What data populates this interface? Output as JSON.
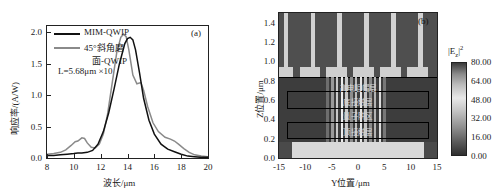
{
  "figure": {
    "panels": [
      "a",
      "b"
    ]
  },
  "panel_a": {
    "tag": "(a)",
    "xlabel": "波长/μm",
    "ylabel": "响应率/(A/W)",
    "annotation": "L=5.68μm  ×10",
    "xticks": [
      "8",
      "10",
      "12",
      "14",
      "16",
      "18",
      "20"
    ],
    "yticks": [
      "0.0",
      "0.5",
      "1.0",
      "1.5",
      "2.0"
    ],
    "legend": [
      {
        "label": "MIM-QWIP",
        "color": "#111111"
      },
      {
        "label": "45°斜角磨",
        "label2": "面-QWIP",
        "color": "#888888"
      }
    ]
  },
  "panel_b": {
    "tag": "(b)",
    "xlabel": "Y位置/μm",
    "ylabel": "Z位置/μm",
    "xticks": [
      "-15",
      "-10",
      "-5",
      "0",
      "5",
      "10",
      "15"
    ],
    "yticks": [
      "0.0",
      "0.2",
      "0.4",
      "0.6",
      "0.8",
      "1.0",
      "1.2",
      "1.4"
    ],
    "region_labels": [
      "高电阻帽层",
      "底接触层",
      "量子阱区",
      "顶接触层"
    ],
    "colorbar": {
      "title_base": "|E",
      "title_sub": "z",
      "title_sup": "2",
      "ticks": [
        "80.00",
        "64.00",
        "48.00",
        "32.00",
        "16.00",
        "0.00"
      ]
    }
  },
  "chart_data": [
    {
      "type": "line",
      "title": "(a)",
      "xlabel": "波长/μm",
      "ylabel": "响应率/(A/W)",
      "xlim": [
        8,
        20
      ],
      "ylim": [
        0.0,
        2.1
      ],
      "grid": false,
      "legend_position": "top-left",
      "annotation": "L=5.68μm  ×10",
      "series": [
        {
          "name": "MIM-QWIP",
          "color": "#111111",
          "x": [
            8.0,
            8.5,
            9.0,
            9.5,
            10.0,
            10.3,
            10.6,
            11.0,
            11.4,
            11.8,
            12.2,
            12.6,
            13.0,
            13.4,
            13.8,
            14.0,
            14.2,
            14.4,
            14.6,
            14.9,
            15.2,
            15.6,
            16.0,
            16.5,
            17.0,
            17.5,
            18.0,
            18.5,
            19.0,
            19.5,
            20.0
          ],
          "y": [
            0.04,
            0.04,
            0.05,
            0.06,
            0.07,
            0.08,
            0.08,
            0.09,
            0.12,
            0.22,
            0.42,
            0.72,
            1.1,
            1.5,
            1.82,
            1.9,
            1.92,
            1.88,
            1.72,
            1.35,
            0.95,
            0.6,
            0.38,
            0.22,
            0.14,
            0.1,
            0.06,
            0.03,
            0.02,
            0.01,
            0.01
          ]
        },
        {
          "name": "45°斜角磨面-QWIP",
          "color": "#8a8a8a",
          "x": [
            8.0,
            8.5,
            9.0,
            9.4,
            9.8,
            10.1,
            10.3,
            10.6,
            10.8,
            11.0,
            11.3,
            11.6,
            11.9,
            12.2,
            12.5,
            12.9,
            13.2,
            13.5,
            13.7,
            13.9,
            14.1,
            14.4,
            14.7,
            15.0,
            15.2,
            15.5,
            15.9,
            16.3,
            16.8,
            17.2,
            17.5,
            17.8,
            18.2,
            18.6,
            19.0,
            19.5,
            20.0
          ],
          "y": [
            0.06,
            0.07,
            0.09,
            0.13,
            0.2,
            0.26,
            0.27,
            0.32,
            0.31,
            0.24,
            0.17,
            0.16,
            0.22,
            0.38,
            0.68,
            1.25,
            1.68,
            1.92,
            1.97,
            1.93,
            1.72,
            1.32,
            1.18,
            1.2,
            1.08,
            0.82,
            0.56,
            0.42,
            0.33,
            0.3,
            0.27,
            0.22,
            0.15,
            0.09,
            0.05,
            0.03,
            0.02
          ]
        }
      ]
    },
    {
      "type": "heatmap",
      "title": "(b)",
      "xlabel": "Y位置/μm",
      "ylabel": "Z位置/μm",
      "xlim": [
        -15,
        15
      ],
      "ylim": [
        0.0,
        1.5
      ],
      "colorbar_label": "|Ez|^2",
      "colorbar_ticks": [
        0.0,
        16.0,
        32.0,
        48.0,
        64.0,
        80.0
      ]
    }
  ]
}
